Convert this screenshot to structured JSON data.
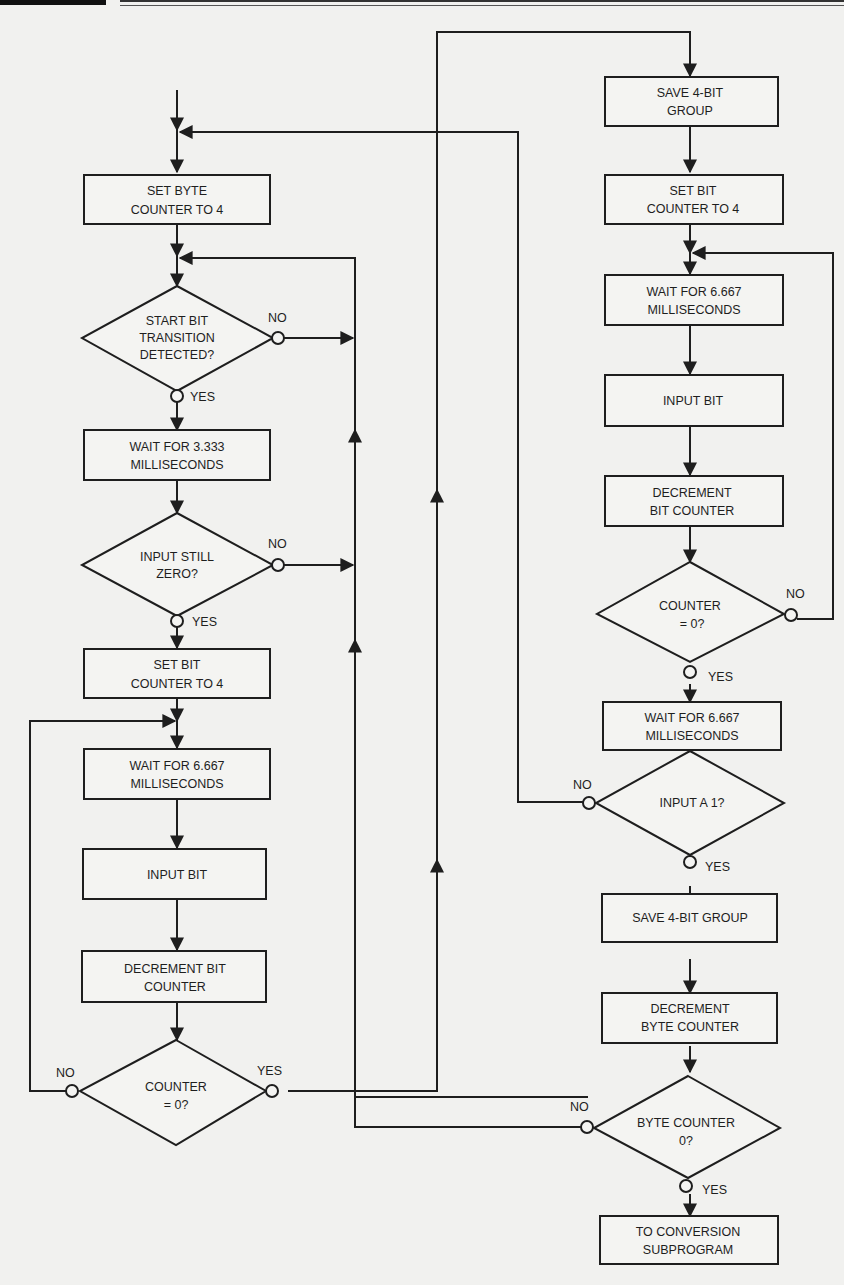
{
  "colors": {
    "ink": "#1e1e1e",
    "paper": "#f1f1ef"
  },
  "header": {
    "decoration": "page-header-rule"
  },
  "flowchart": {
    "left_column": {
      "set_byte_counter": [
        "SET BYTE",
        "COUNTER TO 4"
      ],
      "start_bit_decision": [
        "START BIT",
        "TRANSITION",
        "DETECTED?"
      ],
      "start_bit_no": "NO",
      "start_bit_yes": "YES",
      "wait_3333": [
        "WAIT FOR 3.333",
        "MILLISECONDS"
      ],
      "input_still_zero": [
        "INPUT STILL",
        "ZERO?"
      ],
      "input_still_zero_no": "NO",
      "input_still_zero_yes": "YES",
      "set_bit_counter": [
        "SET BIT",
        "COUNTER TO  4"
      ],
      "wait_6667": [
        "WAIT FOR 6.667",
        "MILLISECONDS"
      ],
      "input_bit": [
        "INPUT BIT"
      ],
      "decrement_bit_counter": [
        "DECREMENT BIT",
        "COUNTER"
      ],
      "counter_zero": [
        "COUNTER",
        "= 0?"
      ],
      "counter_zero_no": "NO",
      "counter_zero_yes": "YES"
    },
    "right_column": {
      "save_4bit_group_a": [
        "SAVE 4-BIT",
        "GROUP"
      ],
      "set_bit_counter": [
        "SET BIT",
        "COUNTER TO 4"
      ],
      "wait_6667_a": [
        "WAIT FOR 6.667",
        "MILLISECONDS"
      ],
      "input_bit": [
        "INPUT BIT"
      ],
      "decrement_bit_counter": [
        "DECREMENT",
        "BIT COUNTER"
      ],
      "counter_zero": [
        "COUNTER",
        "= 0?"
      ],
      "counter_zero_no": "NO",
      "counter_zero_yes": "YES",
      "wait_6667_b": [
        "WAIT FOR 6.667",
        "MILLISECONDS"
      ],
      "input_a_1": [
        "INPUT A 1?"
      ],
      "input_a_1_no": "NO",
      "input_a_1_yes": "YES",
      "save_4bit_group_b": [
        "SAVE 4-BIT GROUP"
      ],
      "decrement_byte_counter": [
        "DECREMENT",
        "BYTE COUNTER"
      ],
      "byte_counter_zero": [
        "BYTE COUNTER",
        "0?"
      ],
      "byte_counter_zero_no": "NO",
      "byte_counter_zero_yes": "YES",
      "to_conversion": [
        "TO CONVERSION",
        "SUBPROGRAM"
      ]
    }
  }
}
